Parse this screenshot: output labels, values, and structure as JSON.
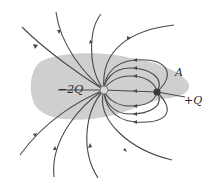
{
  "diagram": {
    "type": "electric-field-lines",
    "charges": [
      {
        "label": "−2Q",
        "x": 104,
        "y": 90,
        "sign": "negative"
      },
      {
        "label": "+Q",
        "x": 157,
        "y": 92,
        "sign": "positive"
      }
    ],
    "point_label": "A",
    "colors": {
      "region": "#cfcfcf",
      "field_line": "#4a4a4a",
      "charge_negative": "#d8d8d8",
      "charge_positive": "#3a3a3a",
      "text": "#2a2a2a"
    }
  },
  "labels": {
    "neg_charge": "−2Q",
    "pos_charge": "+Q",
    "point_a": "A"
  }
}
